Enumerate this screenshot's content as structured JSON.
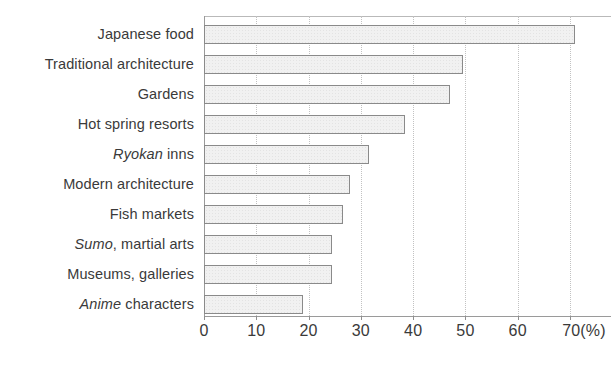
{
  "chart_data": {
    "type": "bar",
    "orientation": "horizontal",
    "title": "",
    "subtitle": "",
    "xlabel": "(%)",
    "ylabel": "",
    "xlim": [
      0,
      70
    ],
    "ylim": null,
    "grid": "vertical dotted gridlines at every 10 units",
    "legend": "none",
    "unit_suffix": "(%)",
    "categories": [
      "Japanese food",
      "Traditional architecture",
      "Gardens",
      "Hot spring resorts",
      "Ryokan inns",
      "Modern architecture",
      "Fish markets",
      "Sumo, martial arts",
      "Museums, galleries",
      "Anime characters"
    ],
    "values": [
      71,
      49.5,
      47,
      38.5,
      31.5,
      28,
      26.5,
      24.5,
      24.5,
      19
    ],
    "xticks": [
      0,
      10,
      20,
      30,
      40,
      50,
      60,
      70
    ],
    "xtick_labels": [
      "0",
      "10",
      "20",
      "30",
      "40",
      "50",
      "60",
      "70(%)"
    ]
  },
  "categories_rich": [
    {
      "index": 0,
      "pre": "",
      "italic": "",
      "post": "Japanese food",
      "value": 71
    },
    {
      "index": 1,
      "pre": "",
      "italic": "",
      "post": "Traditional architecture",
      "value": 49.5
    },
    {
      "index": 2,
      "pre": "",
      "italic": "",
      "post": "Gardens",
      "value": 47
    },
    {
      "index": 3,
      "pre": "",
      "italic": "",
      "post": "Hot spring resorts",
      "value": 38.5
    },
    {
      "index": 4,
      "pre": "",
      "italic": "Ryokan",
      "post": " inns",
      "value": 31.5
    },
    {
      "index": 5,
      "pre": "",
      "italic": "",
      "post": "Modern architecture",
      "value": 28
    },
    {
      "index": 6,
      "pre": "",
      "italic": "",
      "post": "Fish markets",
      "value": 26.5
    },
    {
      "index": 7,
      "pre": "",
      "italic": "Sumo",
      "post": ", martial arts",
      "value": 24.5
    },
    {
      "index": 8,
      "pre": "",
      "italic": "",
      "post": "Museums, galleries",
      "value": 24.5
    },
    {
      "index": 9,
      "pre": "",
      "italic": "Anime",
      "post": " characters",
      "value": 19
    }
  ],
  "style": {
    "bar_fill": "#f1f1f1",
    "bar_border": "#8a8a8a",
    "gridline_color": "#c2c2c2",
    "axis_color": "#9a9a9a",
    "text_color": "#3a3a3a",
    "background": "#ffffff"
  }
}
